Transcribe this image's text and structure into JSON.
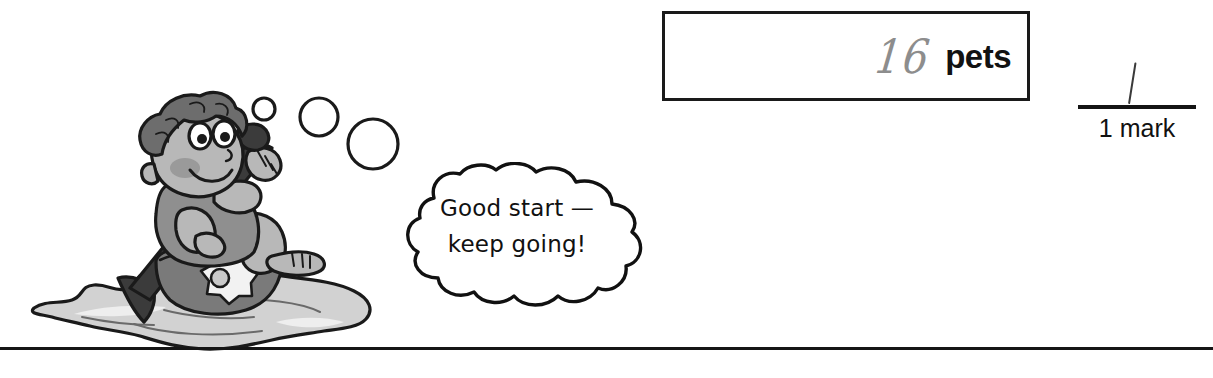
{
  "page": {
    "background_color": "#ffffff",
    "width": 1213,
    "height": 378
  },
  "answer_box": {
    "handwritten_answer": "16",
    "handwritten_color": "#8d8d8d",
    "unit_label": "pets",
    "unit_color": "#121212",
    "border_color": "#1a1a1a"
  },
  "mark_scheme": {
    "tick_mark": "/",
    "label": "1 mark",
    "rule_color": "#141414"
  },
  "encouragement": {
    "line1": "Good start —",
    "line2": "keep going!"
  },
  "illustration": {
    "alt": "cartoon child paddling a kayak through water with bubbles",
    "bubble_count": 3,
    "colors": {
      "outline": "#1a1a1a",
      "skin": "#b8b8b8",
      "skin_shadow": "#9a9a9a",
      "hair": "#6d6d6d",
      "shirt": "#8f8f8f",
      "kayak": "#7a7a7a",
      "paddle": "#3b3b3b",
      "water": "#d2d2d2",
      "water_light": "#eaeaea",
      "flower": "#f2f2f2"
    }
  },
  "bottom_rule": {
    "color": "#151515"
  }
}
